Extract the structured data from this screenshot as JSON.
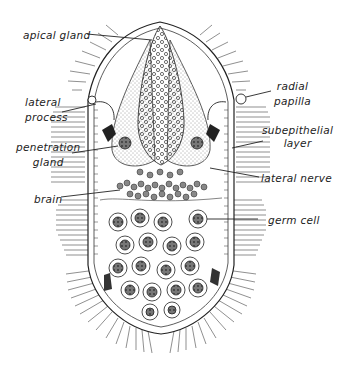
{
  "figure": {
    "background": "#ffffff",
    "ink_color": "#222222"
  },
  "labels": {
    "apical_gland": "apical gland",
    "lateral_process_1": "lateral",
    "lateral_process_2": "process",
    "penetration_gland_1": "penetration",
    "penetration_gland_2": "gland",
    "brain": "brain",
    "radial_papilla_1": "radial",
    "radial_papilla_2": "papilla",
    "subepithelial_layer_1": "subepithelial",
    "subepithelial_layer_2": "layer",
    "lateral_nerve": "lateral nerve",
    "germ_cell": "germ cell"
  }
}
